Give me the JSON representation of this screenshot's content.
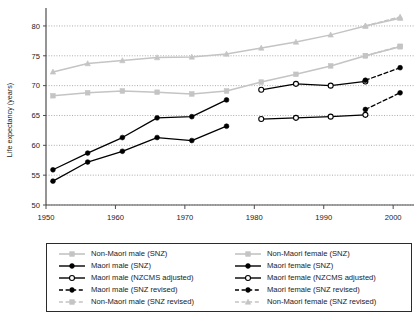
{
  "chart_data": {
    "type": "line",
    "title": "",
    "xlabel": "",
    "ylabel": "Life expectancy (years)",
    "xlim": [
      1950,
      2003
    ],
    "ylim": [
      50,
      82
    ],
    "xticks": [
      1950,
      1960,
      1970,
      1980,
      1990,
      2000
    ],
    "xticklabels": [
      "1950",
      "1960",
      "1970",
      "1980",
      "1990",
      "2000"
    ],
    "yticks": [
      50,
      55,
      60,
      65,
      70,
      75,
      80
    ],
    "yticklabels": [
      "50",
      "55",
      "60",
      "65",
      "70",
      "75",
      "80"
    ],
    "grid": "horizontal-dotted",
    "legend_position": "below-plot",
    "series": [
      {
        "name": "Non-Maori male (SNZ)",
        "color": "#c4c4c4",
        "marker": "square",
        "linestyle": "solid",
        "x": [
          1951,
          1956,
          1961,
          1966,
          1971,
          1976,
          1981,
          1986,
          1991,
          1996,
          2001
        ],
        "y": [
          68.3,
          68.8,
          69.1,
          68.9,
          68.6,
          69.1,
          70.6,
          71.9,
          73.3,
          75.0,
          76.5
        ]
      },
      {
        "name": "Non-Maori female (SNZ)",
        "color": "#c4c4c4",
        "marker": "triangle",
        "linestyle": "solid",
        "x": [
          1951,
          1956,
          1961,
          1966,
          1971,
          1976,
          1981,
          1986,
          1991,
          1996,
          2001
        ],
        "y": [
          72.3,
          73.7,
          74.2,
          74.7,
          74.8,
          75.3,
          76.3,
          77.3,
          78.5,
          80.0,
          81.3
        ]
      },
      {
        "name": "Maori male (SNZ)",
        "color": "#000000",
        "marker": "filled-circle",
        "linestyle": "solid",
        "x": [
          1951,
          1956,
          1961,
          1966,
          1971,
          1976
        ],
        "y": [
          54.0,
          57.2,
          59.0,
          61.3,
          60.8,
          63.2
        ]
      },
      {
        "name": "Maori female (SNZ)",
        "color": "#000000",
        "marker": "filled-circle",
        "linestyle": "solid",
        "x": [
          1951,
          1956,
          1961,
          1966,
          1971,
          1976
        ],
        "y": [
          55.9,
          58.7,
          61.3,
          64.6,
          64.8,
          67.6
        ]
      },
      {
        "name": "Maori male (NZCMS adjusted)",
        "color": "#000000",
        "marker": "open-circle",
        "linestyle": "solid",
        "x": [
          1981,
          1986,
          1991,
          1996
        ],
        "y": [
          64.4,
          64.6,
          64.8,
          65.1
        ]
      },
      {
        "name": "Maori female (NZCMS adjusted)",
        "color": "#000000",
        "marker": "open-circle",
        "linestyle": "solid",
        "x": [
          1981,
          1986,
          1991,
          1996
        ],
        "y": [
          69.3,
          70.3,
          70.0,
          70.7
        ]
      },
      {
        "name": "Maori male (SNZ revised)",
        "color": "#000000",
        "marker": "filled-circle",
        "linestyle": "dashed",
        "x": [
          1996,
          2001
        ],
        "y": [
          66.0,
          68.8
        ]
      },
      {
        "name": "Maori female (SNZ revised)",
        "color": "#000000",
        "marker": "filled-circle",
        "linestyle": "dashed",
        "x": [
          1996,
          2001
        ],
        "y": [
          70.9,
          73.0
        ]
      },
      {
        "name": "Non-Maori male (SNZ revised)",
        "color": "#c4c4c4",
        "marker": "square",
        "linestyle": "dashed",
        "x": [
          1996,
          2001
        ],
        "y": [
          75.0,
          76.6
        ]
      },
      {
        "name": "Non-Maori female (SNZ revised)",
        "color": "#c4c4c4",
        "marker": "triangle",
        "linestyle": "dashed",
        "x": [
          1996,
          2001
        ],
        "y": [
          80.0,
          81.5
        ]
      }
    ]
  },
  "axis": {
    "ylabel": "Life expectancy (years)"
  },
  "legend": {
    "left_column": [
      {
        "label": "Non-Maori male (SNZ)",
        "color": "#c4c4c4",
        "marker": "square",
        "linestyle": "solid"
      },
      {
        "label": "Maori male (SNZ)",
        "color": "#000000",
        "marker": "filled-circle",
        "linestyle": "solid"
      },
      {
        "label": "Maori male (NZCMS adjusted)",
        "color": "#000000",
        "marker": "open-circle",
        "linestyle": "solid"
      },
      {
        "label": "Maori male (SNZ revised)",
        "color": "#000000",
        "marker": "filled-circle",
        "linestyle": "dashed"
      },
      {
        "label": "Non-Maori male (SNZ revised)",
        "color": "#c4c4c4",
        "marker": "square",
        "linestyle": "dashed"
      }
    ],
    "right_column": [
      {
        "label": "Non-Maori female (SNZ)",
        "color": "#c4c4c4",
        "marker": "square",
        "linestyle": "solid"
      },
      {
        "label": "Maori female (SNZ)",
        "color": "#000000",
        "marker": "filled-circle",
        "linestyle": "solid"
      },
      {
        "label": "Maori female (NZCMS adjusted)",
        "color": "#000000",
        "marker": "open-circle",
        "linestyle": "solid"
      },
      {
        "label": "Maori female (SNZ revised)",
        "color": "#000000",
        "marker": "filled-circle",
        "linestyle": "dashed"
      },
      {
        "label": "Non-Maori female (SNZ revised)",
        "color": "#c4c4c4",
        "marker": "triangle",
        "linestyle": "dashed"
      }
    ]
  }
}
